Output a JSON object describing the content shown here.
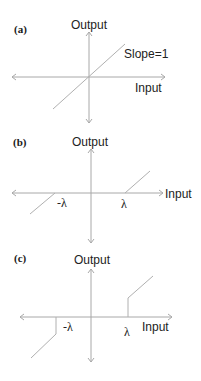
{
  "panels": [
    {
      "id": "a",
      "label": "(a)",
      "y_label": "Output",
      "x_label": "Input",
      "annotation": "Slope=1",
      "function": "identity"
    },
    {
      "id": "b",
      "label": "(b)",
      "y_label": "Output",
      "x_label": "Input",
      "neg_threshold": "-λ",
      "pos_threshold": "λ",
      "function": "soft-threshold"
    },
    {
      "id": "c",
      "label": "(c)",
      "y_label": "Output",
      "x_label": "Input",
      "neg_threshold": "-λ",
      "pos_threshold": "λ",
      "function": "hard-threshold"
    }
  ],
  "colors": {
    "axis": "#a8a8a8",
    "curve": "#b0b0b0",
    "text": "#222222"
  }
}
